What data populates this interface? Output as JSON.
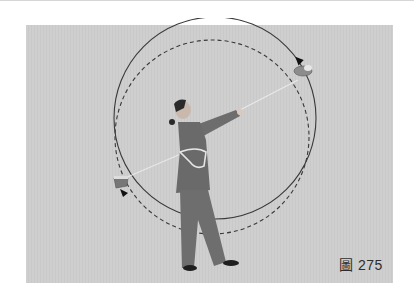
{
  "figure": {
    "caption": "圖 275",
    "background_color": "#cdcdcd",
    "paths": [
      {
        "name": "solid-trajectory",
        "style": "solid",
        "color": "#3a3a3a"
      },
      {
        "name": "dashed-trajectory",
        "style": "dashed",
        "color": "#3a3a3a"
      }
    ],
    "objects": [
      "rope-dart-upper-right",
      "rope-dart-lower-left"
    ],
    "arrows": [
      "clockwise-arrow-upper-right",
      "arrow-lower-left"
    ]
  }
}
